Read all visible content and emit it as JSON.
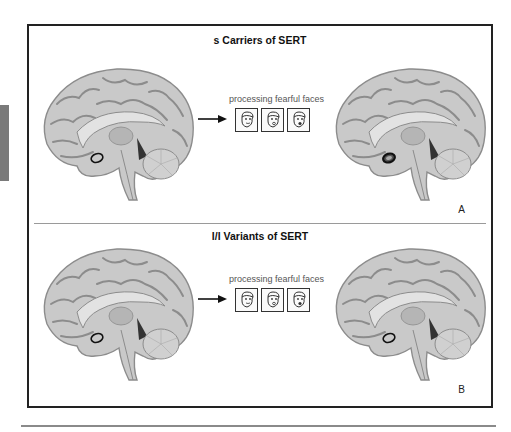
{
  "figure": {
    "panels": [
      {
        "id": "A",
        "title": "s Carriers of SERT",
        "label": "A",
        "stimulus_caption": "processing fearful faces",
        "face_count": 3,
        "amygdala_before": "normal",
        "amygdala_after": "highlighted"
      },
      {
        "id": "B",
        "title": "l/l Variants of SERT",
        "label": "B",
        "stimulus_caption": "processing fearful faces",
        "face_count": 3,
        "amygdala_before": "normal",
        "amygdala_after": "normal"
      }
    ]
  },
  "colors": {
    "frame_border": "#222222",
    "brain_fill": "#c9c9c9",
    "brain_sulci": "#8c8c8c",
    "divider": "#9a9a9a",
    "side_tab": "#7a7a7a",
    "bottom_rule": "#8a8a8a"
  },
  "icons": {
    "brain": "brain-sagittal-icon",
    "arrow": "arrow-right-icon",
    "face": "fearful-face-icon",
    "amygdala_marker": "ellipse-outline-icon"
  }
}
